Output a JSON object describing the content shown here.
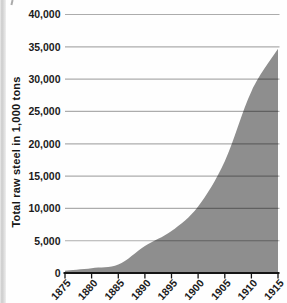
{
  "chart_data": {
    "type": "area",
    "title": "",
    "xlabel": "",
    "ylabel": "Total raw steel in 1,000 tons",
    "x": [
      1875,
      1880,
      1885,
      1890,
      1895,
      1900,
      1905,
      1910,
      1915
    ],
    "values": [
      350,
      750,
      1300,
      4200,
      6500,
      10300,
      17300,
      28100,
      34700
    ],
    "series_name": "Total raw steel (1,000 tons)",
    "x_tick_labels": [
      "1875",
      "1880",
      "1885",
      "1890",
      "1895",
      "1900",
      "1905",
      "1910",
      "1915"
    ],
    "y_ticks": [
      0,
      5000,
      10000,
      15000,
      20000,
      25000,
      30000,
      35000,
      40000
    ],
    "y_tick_labels": [
      "0",
      "5,000",
      "10,000",
      "15,000",
      "20,000",
      "25,000",
      "30,000",
      "35,000",
      "40,000"
    ],
    "xlim": [
      1875,
      1915
    ],
    "ylim": [
      0,
      40000
    ],
    "grid": true,
    "legend": "none",
    "colors": {
      "area_fill": "#8e8e8e",
      "gridline": "rgba(0,0,0,0.32)",
      "axis_line": "#151515",
      "label_text": "#1b1b1b"
    }
  }
}
